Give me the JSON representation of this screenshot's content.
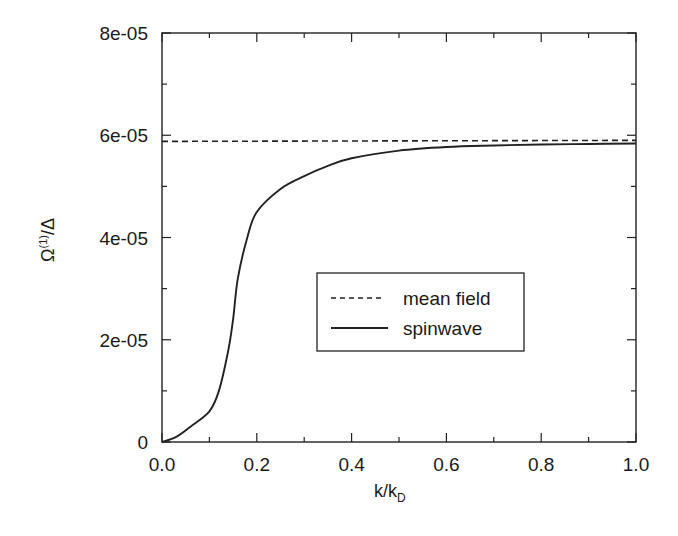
{
  "chart_data": {
    "type": "line",
    "title": "",
    "xlabel": "k/k_D",
    "xlabel_main": "k/k",
    "xlabel_sub": "D",
    "ylabel": "Ω^(1)/Δ",
    "ylabel_main": "Ω",
    "ylabel_sup": "(1)",
    "ylabel_tail": "/Δ",
    "xlim": [
      0.0,
      1.0
    ],
    "ylim": [
      0,
      8e-05
    ],
    "x_ticks": [
      "0.0",
      "0.2",
      "0.4",
      "0.6",
      "0.8",
      "1.0"
    ],
    "y_ticks": [
      "0",
      "2e-05",
      "4e-05",
      "6e-05",
      "8e-05"
    ],
    "grid": false,
    "legend_position": "center-right",
    "series": [
      {
        "name": "mean field",
        "style": "dashed",
        "x": [
          0.0,
          1.0
        ],
        "y": [
          5.88e-05,
          5.9e-05
        ]
      },
      {
        "name": "spinwave",
        "style": "solid",
        "x": [
          0.0,
          0.03,
          0.06,
          0.1,
          0.12,
          0.14,
          0.15,
          0.16,
          0.18,
          0.2,
          0.25,
          0.3,
          0.35,
          0.4,
          0.5,
          0.6,
          0.7,
          0.8,
          0.9,
          1.0
        ],
        "y": [
          0.0,
          1e-06,
          3e-06,
          6e-06,
          1e-05,
          1.8e-05,
          2.4e-05,
          3.2e-05,
          4e-05,
          4.5e-05,
          4.95e-05,
          5.2e-05,
          5.4e-05,
          5.55e-05,
          5.7e-05,
          5.77e-05,
          5.8e-05,
          5.82e-05,
          5.83e-05,
          5.84e-05
        ]
      }
    ]
  }
}
